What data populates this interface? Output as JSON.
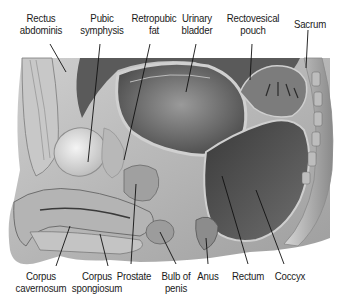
{
  "figure": {
    "style": "grayscale anatomical illustration"
  },
  "labels": {
    "top": [
      {
        "id": "rectus-abdominis",
        "lines": [
          "Rectus",
          "abdominis"
        ]
      },
      {
        "id": "pubic-symphysis",
        "lines": [
          "Pubic",
          "symphysis"
        ]
      },
      {
        "id": "retropubic-fat",
        "lines": [
          "Retropubic",
          "fat"
        ]
      },
      {
        "id": "urinary-bladder",
        "lines": [
          "Urinary",
          "bladder"
        ]
      },
      {
        "id": "rectovesical-pouch",
        "lines": [
          "Rectovesical",
          "pouch"
        ]
      },
      {
        "id": "sacrum",
        "lines": [
          "Sacrum"
        ]
      }
    ],
    "bottom": [
      {
        "id": "corpus-cavernosum",
        "lines": [
          "Corpus",
          "cavernosum"
        ]
      },
      {
        "id": "corpus-spongiosum",
        "lines": [
          "Corpus",
          "spongiosum"
        ]
      },
      {
        "id": "prostate",
        "lines": [
          "Prostate"
        ]
      },
      {
        "id": "bulb-of-penis",
        "lines": [
          "Bulb of",
          "penis"
        ]
      },
      {
        "id": "anus",
        "lines": [
          "Anus"
        ]
      },
      {
        "id": "rectum",
        "lines": [
          "Rectum"
        ]
      },
      {
        "id": "coccyx",
        "lines": [
          "Coccyx"
        ]
      }
    ]
  },
  "colors": {
    "label_text": "#1a1a1a",
    "leader_line": "#111111",
    "background": "#ffffff"
  }
}
